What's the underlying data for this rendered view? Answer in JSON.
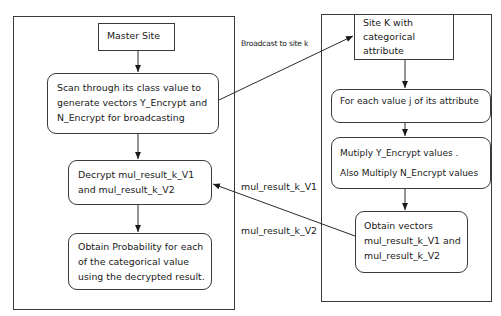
{
  "master": {
    "title": "Master Site",
    "scan_lines": [
      "Scan through its class value to",
      "generate vectors Y_Encrypt and",
      "N_Encrypt for broadcasting"
    ],
    "decrypt_lines": [
      "Decrypt mul_result_k_V1",
      "and mul_result_k_V2"
    ],
    "probability_lines": [
      "Obtain Probability for each",
      "of the categorical value",
      "using the decrypted result."
    ]
  },
  "site_k": {
    "title_lines": [
      "Site K with",
      "categorical",
      "attribute"
    ],
    "for_each": "For each value j of its attribute",
    "multiply_lines": [
      "Mutiply Y_Encrypt values .",
      "Also Multiply N_Encrypt values"
    ],
    "obtain_lines": [
      "Obtain vectors",
      "mul_result_k_V1 and",
      "mul_result_k_V2"
    ]
  },
  "edges": {
    "broadcast_label": "Broadcast to site k",
    "v1_label": "mul_result_k_V1",
    "v2_label": "mul_result_k_V2"
  },
  "colors": {
    "stroke": "#3a3a3a",
    "text": "#1a1a1a",
    "background": "#ffffff"
  }
}
